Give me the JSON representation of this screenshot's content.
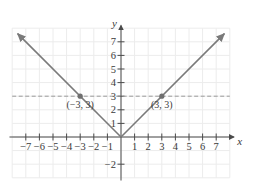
{
  "chart_data": {
    "type": "line",
    "title": "",
    "function": "y = |x|",
    "xlabel": "x",
    "ylabel": "y",
    "xlim": [
      -8,
      8
    ],
    "ylim": [
      -3,
      8
    ],
    "grid": true,
    "x_ticks": [
      -7,
      -6,
      -5,
      -4,
      -3,
      -2,
      -1,
      1,
      2,
      3,
      4,
      5,
      6,
      7
    ],
    "x_tick_labels": [
      "−7",
      "−6",
      "−5",
      "−4",
      "−3",
      "−2",
      "−1",
      "1",
      "2",
      "3",
      "4",
      "5",
      "6",
      "7"
    ],
    "y_ticks": [
      7,
      6,
      5,
      4,
      3,
      2,
      1,
      -2
    ],
    "y_tick_labels": [
      "7",
      "6",
      "5",
      "4",
      "3",
      "2",
      "1",
      "−2"
    ],
    "series": [
      {
        "name": "y = |x|",
        "x": [
          -7.6,
          0,
          7.6
        ],
        "y": [
          7.6,
          0,
          7.6
        ],
        "color": "#7a7a7a",
        "arrows": true
      }
    ],
    "reference_lines": [
      {
        "type": "horizontal",
        "y": 3,
        "style": "dashed",
        "color": "#9a9a9a"
      }
    ],
    "points": [
      {
        "x": -3,
        "y": 3,
        "label": "(−3, 3)"
      },
      {
        "x": 3,
        "y": 3,
        "label": "(3, 3)"
      }
    ],
    "colors": {
      "grid": "#ececec",
      "axis": "#4a4a4a",
      "curve": "#7a7a7a",
      "point": "#707070",
      "dashed": "#a0a0a0"
    }
  }
}
